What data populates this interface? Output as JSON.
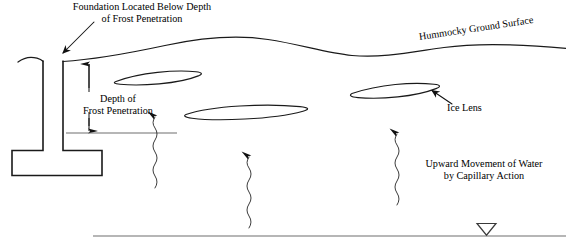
{
  "diagram": {
    "labels": {
      "foundation_note_line1": "Foundation Located Below Depth",
      "foundation_note_line2": "of Frost Penetration",
      "depth_frost_line1": "Depth of",
      "depth_frost_line2": "Frost Penetration",
      "hummocky_surface": "Hummocky Ground Surface",
      "ice_lens": "Ice Lens",
      "capillary_line1": "Upward Movement of Water",
      "capillary_line2": "by Capillary Action"
    },
    "symbols": {
      "water_table": "▽"
    },
    "colors": {
      "ink": "#111111",
      "ground_line": "#1a1a1a",
      "frost_line": "#6e6e6e",
      "water_table_line": "#6e6e6e",
      "background": "#ffffff"
    }
  }
}
